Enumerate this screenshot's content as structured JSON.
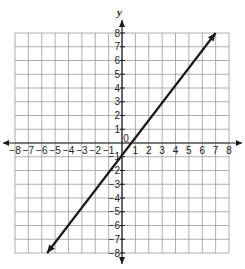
{
  "chart_data": {
    "type": "line",
    "title": "",
    "xlabel": "",
    "ylabel": "y",
    "xlim": [
      -8,
      8
    ],
    "ylim": [
      -8,
      8
    ],
    "grid": true,
    "x_ticks": [
      -8,
      -7,
      -6,
      -5,
      -4,
      -3,
      -2,
      -1,
      1,
      2,
      3,
      4,
      5,
      6,
      7,
      8
    ],
    "y_ticks": [
      -8,
      -7,
      -6,
      -5,
      -4,
      -3,
      -2,
      -1,
      1,
      2,
      3,
      4,
      5,
      6,
      7,
      8
    ],
    "origin_label": "0",
    "series": [
      {
        "name": "line",
        "x": [
          -5.6,
          7.0
        ],
        "y": [
          -8.0,
          8.0
        ],
        "arrows": "both",
        "color": "#1a1a1a"
      }
    ]
  },
  "colors": {
    "grid": "#9a9a9a",
    "axis": "#1a1a1a",
    "line": "#1a1a1a"
  }
}
